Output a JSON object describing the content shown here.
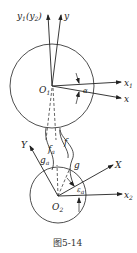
{
  "figure": {
    "caption": "图5-14",
    "stroke_color": "#222222",
    "background": "#ffffff"
  },
  "upper_gear": {
    "origin_label": "O",
    "origin_sub": "1",
    "axis_y1_label": "y",
    "axis_y1_sub": "1",
    "axis_y1_paren": "(y",
    "axis_y1_paren_sub": "2",
    "axis_y1_close": ")",
    "axis_y_label": "y",
    "axis_x1_label": "x",
    "axis_x1_sub": "1",
    "axis_x_label": "x",
    "angle_label": "α"
  },
  "curves": {
    "f_a_label": "f",
    "f_a_sub": "a",
    "f_label": "f",
    "g_a_label": "g",
    "g_a_sub": "a",
    "g_label": "g"
  },
  "lower_gear": {
    "origin_label": "O",
    "origin_sub": "2",
    "axis_Y_label": "Y",
    "axis_X_label": "X",
    "axis_x2_label": "x",
    "axis_x2_sub": "2",
    "angle_label": "ε",
    "angle_sub": "a"
  }
}
